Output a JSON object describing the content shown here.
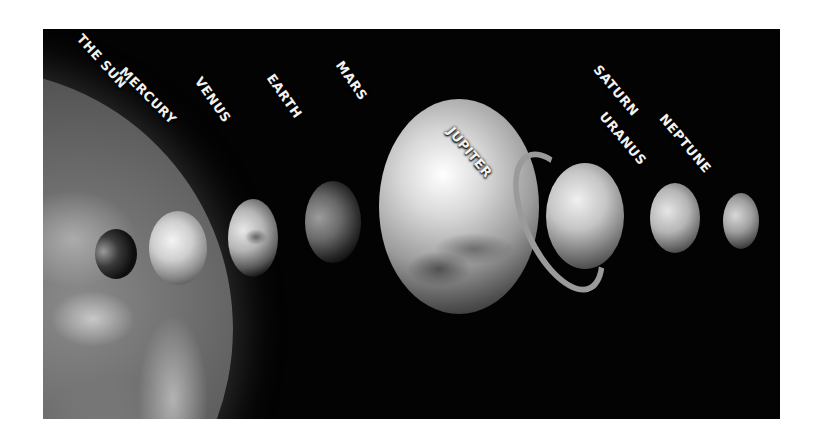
{
  "figure": {
    "style": "grayscale illustration",
    "background_color": "#030303",
    "labels": {
      "sun": "THE SUN",
      "mercury": "MERCURY",
      "venus": "VENUS",
      "earth": "EARTH",
      "mars": "MARS",
      "jupiter": "JUPITER",
      "saturn": "SATURN",
      "uranus": "URANUS",
      "neptune": "NEPTUNE"
    }
  }
}
